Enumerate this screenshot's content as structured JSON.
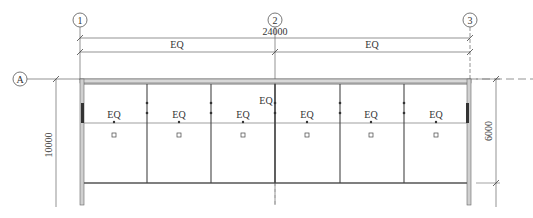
{
  "drawing": {
    "grid_columns": [
      {
        "label": "1",
        "x": 80
      },
      {
        "label": "2",
        "x": 275
      },
      {
        "label": "3",
        "x": 470
      }
    ],
    "grid_rows": [
      {
        "label": "A",
        "y": 79
      }
    ],
    "dimensions": {
      "overall_width": "24000",
      "half_left": "EQ",
      "half_right": "EQ",
      "right_height": "6000",
      "left_height": "10000"
    },
    "bays": [
      {
        "label": "EQ"
      },
      {
        "label": "EQ"
      },
      {
        "label": "EQ"
      },
      {
        "label": "EQ"
      },
      {
        "label": "EQ"
      },
      {
        "label": "EQ"
      }
    ],
    "center_label": "EQ",
    "colors": {
      "line": "#555555",
      "wall": "#888888",
      "text": "#333333"
    }
  }
}
